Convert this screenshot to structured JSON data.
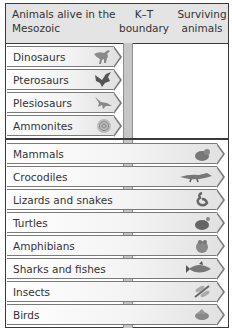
{
  "header": {
    "col1": "Animals alive in the Mesozoic",
    "col2": "K–T boundary",
    "col3": "Surviving animals"
  },
  "extinct_groups": [
    {
      "label": "Dinosaurs",
      "icon": "dinosaur-icon"
    },
    {
      "label": "Pterosaurs",
      "icon": "pterosaur-icon"
    },
    {
      "label": "Plesiosaurs",
      "icon": "plesiosaur-icon"
    },
    {
      "label": "Ammonites",
      "icon": "ammonite-icon"
    }
  ],
  "surviving_groups": [
    {
      "label": "Mammals",
      "icon": "mammal-icon"
    },
    {
      "label": "Crocodiles",
      "icon": "crocodile-icon"
    },
    {
      "label": "Lizards and snakes",
      "icon": "snake-icon"
    },
    {
      "label": "Turtles",
      "icon": "turtle-icon"
    },
    {
      "label": "Amphibians",
      "icon": "frog-icon"
    },
    {
      "label": "Sharks and fishes",
      "icon": "fish-icon"
    },
    {
      "label": "Insects",
      "icon": "insect-icon"
    },
    {
      "label": "Birds",
      "icon": "bird-icon"
    }
  ],
  "colors": {
    "header_bg": "#e4e4e4",
    "boundary_bar": "#c6c6c6",
    "border": "#3a3a3a"
  }
}
